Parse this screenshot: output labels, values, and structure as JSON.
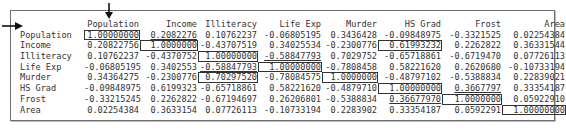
{
  "frame": {
    "column_headers": [
      "",
      "Population",
      "Income",
      "Illiteracy",
      "Life Exp",
      "Murder",
      "HS Grad",
      "Frost",
      "Area"
    ],
    "rows": [
      {
        "label": "Population",
        "values": [
          "1.00000000",
          "0.2082276",
          "0.10762237",
          "-0.06805195",
          "0.3436428",
          "-0.09848975",
          "-0.3321525",
          "0.02254384"
        ]
      },
      {
        "label": "Income",
        "values": [
          "0.20822756",
          "1.0000000",
          "-0.43707519",
          "0.34025534",
          "-0.2300776",
          "0.61993232",
          "0.2262822",
          "0.36331544"
        ]
      },
      {
        "label": "Illiteracy",
        "values": [
          "0.10762237",
          "-0.4370752",
          "1.00000000",
          "-0.58847793",
          "0.7029752",
          "-0.65718861",
          "-0.6719470",
          "0.07726113"
        ]
      },
      {
        "label": "Life Exp",
        "values": [
          "-0.06805195",
          "0.3402553",
          "-0.58847793",
          "1.00000000",
          "-0.7808458",
          "0.58221620",
          "0.2620680",
          "-0.10733194"
        ]
      },
      {
        "label": "Murder",
        "values": [
          "0.34364275",
          "-0.2300776",
          "0.70297520",
          "-0.78084575",
          "1.0000000",
          "-0.48797102",
          "-0.5388834",
          "0.22839021"
        ]
      },
      {
        "label": "HS Grad",
        "values": [
          "-0.09848975",
          "0.6199323",
          "-0.65718861",
          "0.58221620",
          "-0.4879710",
          "1.00000000",
          "0.3667797",
          "0.33354187"
        ]
      },
      {
        "label": "Frost",
        "values": [
          "-0.33215245",
          "0.2262822",
          "-0.67194697",
          "0.26206801",
          "-0.5388834",
          "0.36677970",
          "1.0000000",
          "0.05922910"
        ]
      },
      {
        "label": "Area",
        "values": [
          "0.02254384",
          "0.3633154",
          "0.07726113",
          "-0.10733194",
          "0.2283902",
          "0.33354187",
          "0.0592291",
          "1.00000000"
        ]
      }
    ],
    "boxed_cells": [
      [
        0,
        0
      ],
      [
        1,
        1
      ],
      [
        2,
        2
      ],
      [
        3,
        3
      ],
      [
        4,
        4
      ],
      [
        5,
        5
      ],
      [
        6,
        6
      ],
      [
        7,
        7
      ],
      [
        1,
        5
      ],
      [
        4,
        2
      ]
    ],
    "underlined_cells": [
      [
        0,
        1
      ],
      [
        2,
        3
      ],
      [
        3,
        2
      ],
      [
        5,
        6
      ],
      [
        6,
        5
      ]
    ],
    "annotations": {
      "down_arrow_icon": "arrow pointing to Population column",
      "right_arrow_icon": "arrow pointing to Population row"
    }
  }
}
